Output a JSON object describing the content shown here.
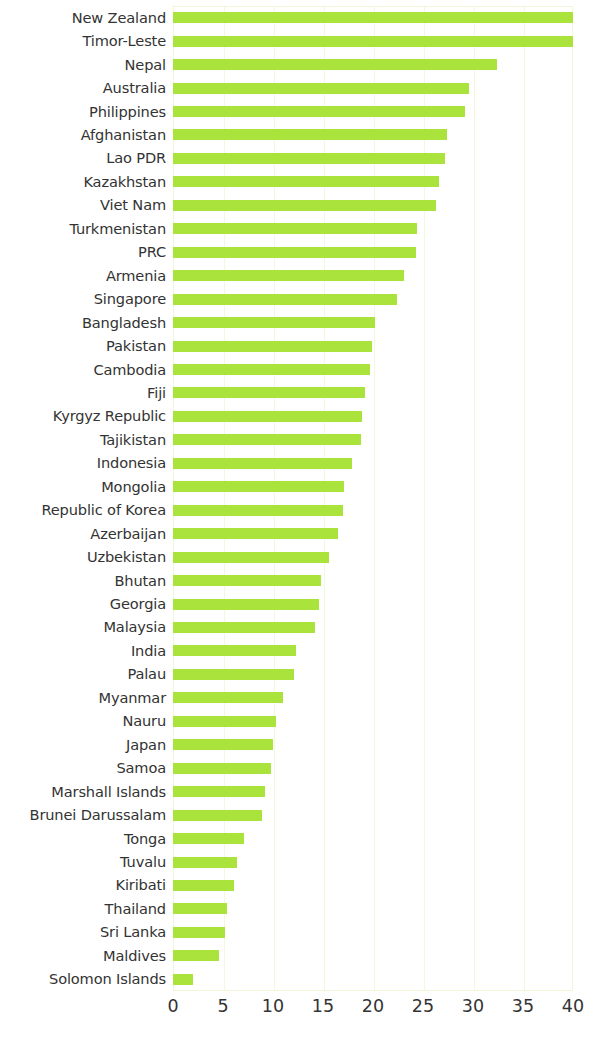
{
  "chart": {
    "type": "bar",
    "orientation": "horizontal",
    "bar_color": "#a9e33c",
    "grid_color": "#f2f8dc",
    "plot_border_color": "#f0f7d8",
    "background": "#ffffff"
  },
  "chart_data": {
    "type": "bar",
    "title": "",
    "subtitle": "",
    "xlabel": "",
    "ylabel": "",
    "orientation": "horizontal",
    "grid": true,
    "legend": null,
    "xlim": [
      0,
      40
    ],
    "xticks": [
      0,
      5,
      10,
      15,
      20,
      25,
      30,
      35,
      40
    ],
    "xtick_labels": [
      "0",
      "5",
      "10",
      "15",
      "20",
      "25",
      "30",
      "35",
      "40"
    ],
    "categories": [
      "New Zealand",
      "Timor-Leste",
      "Nepal",
      "Australia",
      "Philippines",
      "Afghanistan",
      "Lao PDR",
      "Kazakhstan",
      "Viet Nam",
      "Turkmenistan",
      "PRC",
      "Armenia",
      "Singapore",
      "Bangladesh",
      "Pakistan",
      "Cambodia",
      "Fiji",
      "Kyrgyz Republic",
      "Tajikistan",
      "Indonesia",
      "Mongolia",
      "Republic of Korea",
      "Azerbaijan",
      "Uzbekistan",
      "Bhutan",
      "Georgia",
      "Malaysia",
      "India",
      "Palau",
      "Myanmar",
      "Nauru",
      "Japan",
      "Samoa",
      "Marshall Islands",
      "Brunei Darussalam",
      "Tonga",
      "Tuvalu",
      "Kiribati",
      "Thailand",
      "Sri Lanka",
      "Maldives",
      "Solomon Islands"
    ],
    "values": [
      40.0,
      40.0,
      32.4,
      29.6,
      29.2,
      27.4,
      27.2,
      26.6,
      26.3,
      24.4,
      24.3,
      23.1,
      22.4,
      20.2,
      19.9,
      19.7,
      19.2,
      18.9,
      18.8,
      17.9,
      17.1,
      17.0,
      16.5,
      15.6,
      14.8,
      14.6,
      14.2,
      12.3,
      12.1,
      11.0,
      10.3,
      10.0,
      9.8,
      9.2,
      8.9,
      7.1,
      6.4,
      6.1,
      5.4,
      5.2,
      4.6,
      2.0
    ]
  }
}
